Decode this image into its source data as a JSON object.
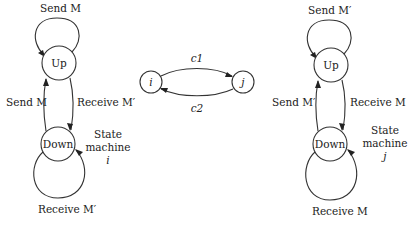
{
  "machine_i": {
    "states": {
      "up": "Up",
      "down": "Down"
    },
    "self_loop_up": "Send M",
    "edge_down_to_up": "Send M",
    "edge_up_to_down": "Receive M′",
    "self_loop_down": "Receive M′",
    "caption_line1": "State",
    "caption_line2": "machine",
    "caption_line3": "i"
  },
  "channels": {
    "node_i": "i",
    "node_j": "j",
    "c1": "c1",
    "c2": "c2"
  },
  "machine_j": {
    "states": {
      "up": "Up",
      "down": "Down"
    },
    "self_loop_up": "Send M′",
    "edge_down_to_up": "Send M′",
    "edge_up_to_down": "Receive M",
    "self_loop_down": "Receive M",
    "caption_line1": "State",
    "caption_line2": "machine",
    "caption_line3": "j"
  }
}
